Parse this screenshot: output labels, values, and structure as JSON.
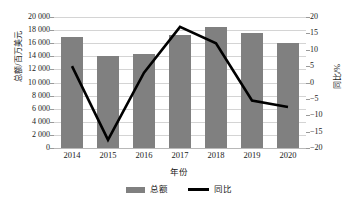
{
  "chart_data": {
    "type": "bar",
    "title": "",
    "subtitle": "",
    "xlabel": "年份",
    "categories": [
      "2014",
      "2015",
      "2016",
      "2017",
      "2018",
      "2019",
      "2020"
    ],
    "grid": true,
    "legend_position": "bottom",
    "axes": {
      "left": {
        "label": "总额/百万美元",
        "min": 0,
        "max": 20000,
        "step": 2000,
        "ticks": [
          "0",
          "2 000",
          "4 000",
          "6 000",
          "8 000",
          "10 000",
          "12 000",
          "14 000",
          "16 000",
          "18 000",
          "20 000"
        ]
      },
      "right": {
        "label": "同比/%",
        "min": -20,
        "max": 20,
        "step": 5,
        "ticks": [
          "−20",
          "−15",
          "−10",
          "−5",
          "0",
          "5",
          "10",
          "15",
          "20"
        ]
      }
    },
    "series": [
      {
        "name": "总额",
        "type": "bar",
        "axis": "left",
        "color": "#808080",
        "values": [
          17000,
          14000,
          14400,
          17300,
          18500,
          17500,
          16000
        ]
      },
      {
        "name": "同比",
        "type": "line",
        "axis": "right",
        "color": "#000000",
        "values": [
          5,
          -17.5,
          3,
          17,
          12,
          -5.5,
          -7.5
        ]
      }
    ]
  },
  "legend": {
    "items": [
      {
        "label": "总额",
        "marker": "bar-swatch-icon",
        "color": "#808080"
      },
      {
        "label": "同比",
        "marker": "line-swatch-icon",
        "color": "#000000"
      }
    ]
  }
}
